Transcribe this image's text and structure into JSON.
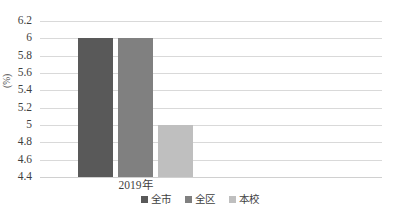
{
  "chart_data": {
    "type": "bar",
    "title": "",
    "subtitle": "",
    "xlabel": "",
    "ylabel": "(%)",
    "categories": [
      "2019年"
    ],
    "series": [
      {
        "name": "全市",
        "values": [
          6
        ],
        "color": "#595959"
      },
      {
        "name": "全区",
        "values": [
          6
        ],
        "color": "#808080"
      },
      {
        "name": "本校",
        "values": [
          5
        ],
        "color": "#bfbfbf"
      }
    ],
    "ylim": [
      4.4,
      6.2
    ],
    "ytick_step": 0.2,
    "ytick_labels": [
      "6.2",
      "6",
      "5.8",
      "5.6",
      "5.4",
      "5.2",
      "5",
      "4.8",
      "4.6",
      "4.4"
    ],
    "ytick_values": [
      6.2,
      6,
      5.8,
      5.6,
      5.4,
      5.2,
      5,
      4.8,
      4.6,
      4.4
    ],
    "grid": true,
    "grid_color": "#d9d9d9",
    "legend_position": "bottom",
    "background": "#ffffff"
  },
  "legend": {
    "items": [
      {
        "label": "全市",
        "color": "#595959"
      },
      {
        "label": "全区",
        "color": "#808080"
      },
      {
        "label": "本校",
        "color": "#bfbfbf"
      }
    ]
  },
  "axes": {
    "y_title": "(%)",
    "x_categories": [
      "2019年"
    ]
  }
}
